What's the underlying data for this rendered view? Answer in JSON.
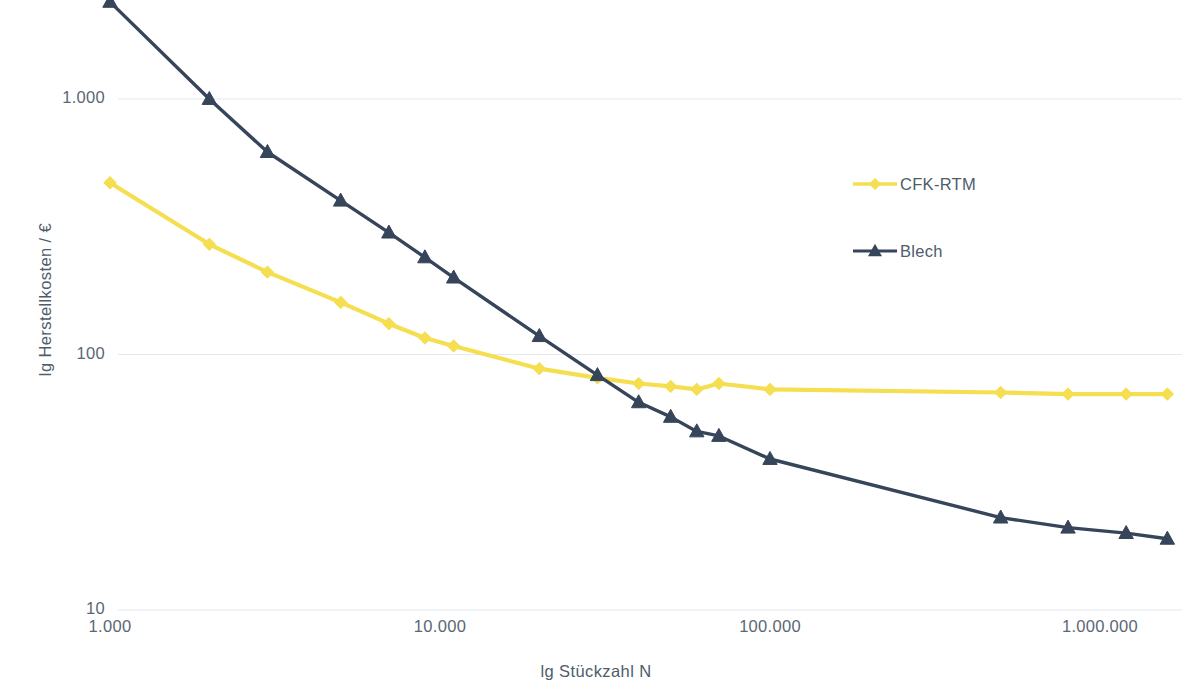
{
  "chart_data": {
    "type": "line",
    "title": "",
    "xlabel": "lg  Stückzahl N",
    "ylabel": "lg  Herstellkosten / €",
    "xscale": "log",
    "yscale": "log",
    "xlim": [
      1000,
      1800000
    ],
    "ylim": [
      10,
      2600
    ],
    "grid": true,
    "grid_axis": "y",
    "legend_position": "right-upper-inside",
    "xticks": [
      "1.000",
      "10.000",
      "100.000",
      "1.000.000"
    ],
    "xtick_values": [
      1000,
      10000,
      100000,
      1000000
    ],
    "yticks": [
      "10",
      "100",
      "1.000"
    ],
    "ytick_values": [
      10,
      100,
      1000
    ],
    "series": [
      {
        "name": "CFK-RTM",
        "color": "#F5DE50",
        "marker": "diamond",
        "x": [
          1000,
          2000,
          3000,
          5000,
          7000,
          9000,
          11000,
          20000,
          30000,
          40000,
          50000,
          60000,
          70000,
          100000,
          500000,
          800000,
          1200000,
          1600000
        ],
        "y": [
          470,
          270,
          210,
          160,
          132,
          116,
          108,
          88,
          81,
          77,
          75,
          73,
          77,
          73,
          71,
          70,
          70,
          70
        ]
      },
      {
        "name": "Blech",
        "color": "#36455A",
        "marker": "triangle",
        "x": [
          1000,
          2000,
          3000,
          5000,
          7000,
          9000,
          11000,
          20000,
          30000,
          40000,
          50000,
          60000,
          70000,
          100000,
          500000,
          800000,
          1200000,
          1600000
        ],
        "y": [
          2400,
          1000,
          620,
          400,
          300,
          240,
          200,
          118,
          83,
          65,
          57,
          50,
          48,
          39,
          23,
          21,
          20,
          19
        ]
      }
    ]
  },
  "axes": {
    "y_title": "lg  Herstellkosten / €",
    "x_title": "lg  Stückzahl N",
    "y_ticks": [
      {
        "label": "1.000",
        "value": 1000
      },
      {
        "label": "100",
        "value": 100
      },
      {
        "label": "10",
        "value": 10
      }
    ],
    "x_ticks": [
      {
        "label": "1.000",
        "value": 1000
      },
      {
        "label": "10.000",
        "value": 10000
      },
      {
        "label": "100.000",
        "value": 100000
      },
      {
        "label": "1.000.000",
        "value": 1000000
      }
    ]
  },
  "legend": {
    "items": [
      {
        "label": "CFK-RTM",
        "color": "#F5DE50",
        "marker": "diamond"
      },
      {
        "label": "Blech",
        "color": "#36455A",
        "marker": "triangle"
      }
    ]
  },
  "colors": {
    "series_cfk_rtm": "#F5DE50",
    "series_blech": "#36455A",
    "gridline": "#E4E8F0",
    "text": "#4E5C6B",
    "background": "#FFFFFF"
  }
}
